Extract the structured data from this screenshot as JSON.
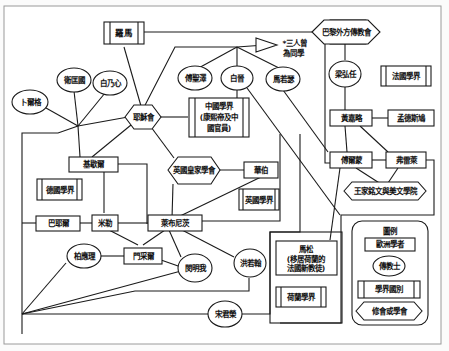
{
  "diagram": {
    "nodes": {
      "luoma": {
        "label": "羅馬",
        "type": "field"
      },
      "sanren": {
        "label_line1": "*三人曾",
        "label_line2": "為同學",
        "type": "note"
      },
      "bali": {
        "label": "巴黎外方傳教會",
        "type": "society"
      },
      "bujiege": {
        "label": "卜爾格",
        "type": "jesuit"
      },
      "weikuangguo": {
        "label": "衛匡國",
        "type": "jesuit"
      },
      "bainaixin": {
        "label": "白乃心",
        "type": "jesuit"
      },
      "yesuhui": {
        "label": "耶穌會",
        "type": "society"
      },
      "fushengze": {
        "label": "傅聖澤",
        "type": "jesuit"
      },
      "baijin": {
        "label": "白晉",
        "type": "jesuit"
      },
      "maruose": {
        "label": "馬若瑟",
        "type": "jesuit"
      },
      "zhongguo": {
        "label_line1": "中國學界",
        "label_line2": "(康熙帝及中",
        "label_line3": "國官員)",
        "type": "field"
      },
      "lianghongren": {
        "label": "梁弘任",
        "type": "jesuit"
      },
      "faguo": {
        "label": "法國學界",
        "type": "field"
      },
      "huangjialue": {
        "label": "黃嘉略",
        "type": "scholar"
      },
      "mengdesijiu": {
        "label": "孟德斯鳩",
        "type": "scholar"
      },
      "jichaer": {
        "label": "基歇爾",
        "type": "scholar"
      },
      "deguo": {
        "label": "德國學界",
        "type": "field"
      },
      "yingguohuangjia": {
        "label": "英國皇家學會",
        "type": "society"
      },
      "huabo": {
        "label": "華伯",
        "type": "scholar"
      },
      "yingguo": {
        "label": "英國學界",
        "type": "field"
      },
      "fuermeng": {
        "label": "傅爾蒙",
        "type": "scholar"
      },
      "fuleilai": {
        "label": "弗雷萊",
        "type": "scholar"
      },
      "wangjia": {
        "label": "王家銘文與美文學院",
        "type": "society"
      },
      "baeryuer": {
        "label": "巴耶爾",
        "type": "scholar"
      },
      "mile": {
        "label": "米勒",
        "type": "scholar"
      },
      "laibunici": {
        "label": "萊布尼茨",
        "type": "scholar"
      },
      "bailiangli": {
        "label": "柏應理",
        "type": "jesuit"
      },
      "mencaier": {
        "label": "門采爾",
        "type": "scholar"
      },
      "minmingwo": {
        "label": "閔明我",
        "type": "jesuit"
      },
      "hongruohan": {
        "label": "洪若翰",
        "type": "jesuit"
      },
      "masong": {
        "label_line1": "馬松",
        "label_line2": "(移居荷蘭的",
        "label_line3": "法國新教徒)",
        "type": "scholar"
      },
      "helan": {
        "label": "荷蘭學界",
        "type": "field"
      },
      "songjunrong": {
        "label": "宋君榮",
        "type": "jesuit"
      }
    },
    "legend": {
      "title": "圖例",
      "scholar": "歐洲學者",
      "jesuit": "傳教士",
      "field": "學界國別",
      "society": "修會或學會"
    }
  }
}
